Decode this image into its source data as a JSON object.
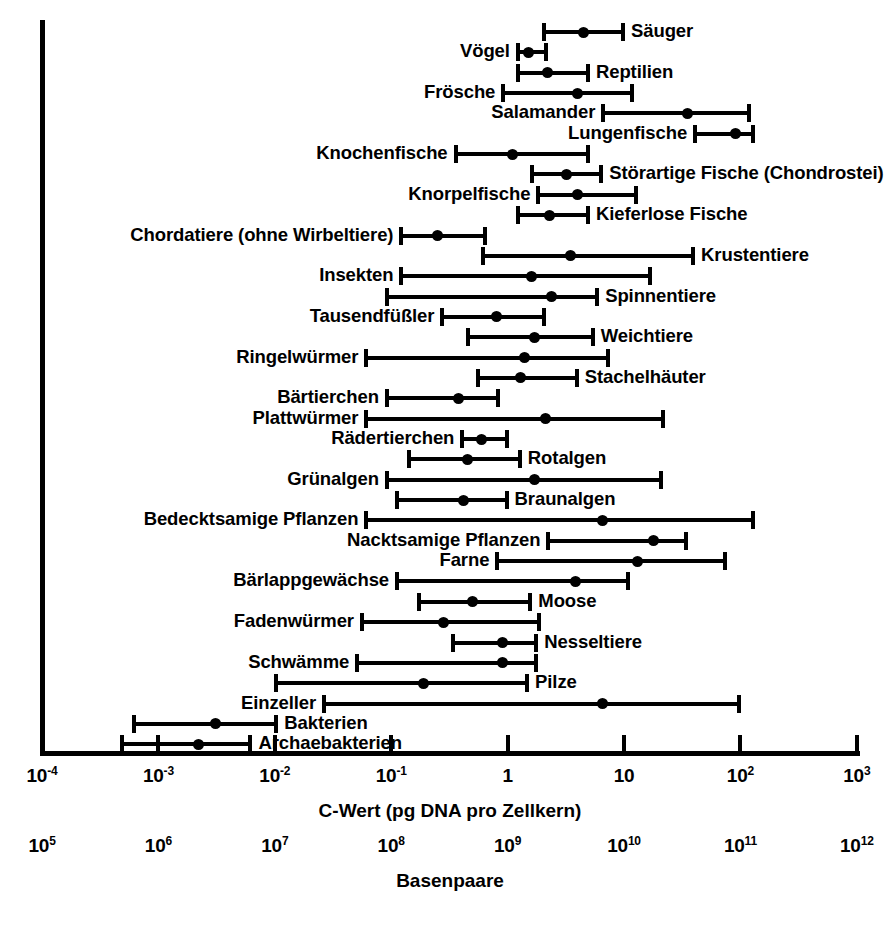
{
  "chart_data": {
    "type": "bar",
    "title": "",
    "xlabel": "C-Wert (pg DNA pro Zellkern)",
    "xlabel_secondary": "Basenpaare",
    "ylabel": "",
    "scale": "log",
    "xlim": [
      0.0001,
      1000
    ],
    "grid": false,
    "legend": null,
    "axis_primary": {
      "caption": "C-Wert (pg DNA pro Zellkern)",
      "ticks": [
        {
          "value": 0.0001,
          "label": "10",
          "exp": "-4"
        },
        {
          "value": 0.001,
          "label": "10",
          "exp": "-3"
        },
        {
          "value": 0.01,
          "label": "10",
          "exp": "-2"
        },
        {
          "value": 0.1,
          "label": "10",
          "exp": "-1"
        },
        {
          "value": 1,
          "label": "1",
          "exp": ""
        },
        {
          "value": 10,
          "label": "10",
          "exp": ""
        },
        {
          "value": 100,
          "label": "10",
          "exp": "2"
        },
        {
          "value": 1000,
          "label": "10",
          "exp": "3"
        }
      ]
    },
    "axis_secondary": {
      "caption": "Basenpaare",
      "ticks": [
        {
          "label": "10",
          "exp": "5"
        },
        {
          "label": "10",
          "exp": "6"
        },
        {
          "label": "10",
          "exp": "7"
        },
        {
          "label": "10",
          "exp": "8"
        },
        {
          "label": "10",
          "exp": "9"
        },
        {
          "label": "10",
          "exp": "10"
        },
        {
          "label": "10",
          "exp": "11"
        },
        {
          "label": "10",
          "exp": "12"
        }
      ]
    },
    "series_note": "Each row: min and max C-value (range whiskers) with a typical/median dot.",
    "rows": [
      {
        "label": "Säuger",
        "side": "right",
        "min": 2.0,
        "typical": 4.5,
        "max": 10.0
      },
      {
        "label": "Vögel",
        "side": "left",
        "min": 1.2,
        "typical": 1.5,
        "max": 2.2
      },
      {
        "label": "Reptilien",
        "side": "right",
        "min": 1.2,
        "typical": 2.2,
        "max": 5.0
      },
      {
        "label": "Frösche",
        "side": "left",
        "min": 0.9,
        "typical": 4.0,
        "max": 12.0
      },
      {
        "label": "Salamander",
        "side": "left",
        "min": 6.5,
        "typical": 35.0,
        "max": 120.0
      },
      {
        "label": "Lungenfische",
        "side": "left",
        "min": 40.0,
        "typical": 90.0,
        "max": 130.0
      },
      {
        "label": "Knochenfische",
        "side": "left",
        "min": 0.35,
        "typical": 1.1,
        "max": 5.0
      },
      {
        "label": "Störartige Fische (Chondrostei)",
        "side": "right",
        "min": 1.6,
        "typical": 3.2,
        "max": 6.5
      },
      {
        "label": "Knorpelfische",
        "side": "left",
        "min": 1.8,
        "typical": 4.0,
        "max": 13.0
      },
      {
        "label": "Kieferlose Fische",
        "side": "right",
        "min": 1.2,
        "typical": 2.3,
        "max": 5.0
      },
      {
        "label": "Chordatiere (ohne Wirbeltiere)",
        "side": "left",
        "min": 0.12,
        "typical": 0.25,
        "max": 0.65
      },
      {
        "label": "Krustentiere",
        "side": "right",
        "min": 0.6,
        "typical": 3.5,
        "max": 40.0
      },
      {
        "label": "Insekten",
        "side": "left",
        "min": 0.12,
        "typical": 1.6,
        "max": 17.0
      },
      {
        "label": "Spinnentiere",
        "side": "right",
        "min": 0.09,
        "typical": 2.4,
        "max": 6.0
      },
      {
        "label": "Tausendfüßler",
        "side": "left",
        "min": 0.27,
        "typical": 0.8,
        "max": 2.1
      },
      {
        "label": "Weichtiere",
        "side": "right",
        "min": 0.45,
        "typical": 1.7,
        "max": 5.5
      },
      {
        "label": "Ringelwürmer",
        "side": "left",
        "min": 0.06,
        "typical": 1.4,
        "max": 7.5
      },
      {
        "label": "Stachelhäuter",
        "side": "right",
        "min": 0.55,
        "typical": 1.3,
        "max": 4.0
      },
      {
        "label": "Bärtierchen",
        "side": "left",
        "min": 0.09,
        "typical": 0.38,
        "max": 0.85
      },
      {
        "label": "Plattwürmer",
        "side": "left",
        "min": 0.06,
        "typical": 2.1,
        "max": 22.0
      },
      {
        "label": "Rädertierchen",
        "side": "left",
        "min": 0.4,
        "typical": 0.6,
        "max": 1.0
      },
      {
        "label": "Rotalgen",
        "side": "right",
        "min": 0.14,
        "typical": 0.45,
        "max": 1.3
      },
      {
        "label": "Grünalgen",
        "side": "left",
        "min": 0.09,
        "typical": 1.7,
        "max": 21.0
      },
      {
        "label": "Braunalgen",
        "side": "right",
        "min": 0.11,
        "typical": 0.42,
        "max": 1.0
      },
      {
        "label": "Bedecktsamige Pflanzen",
        "side": "left",
        "min": 0.06,
        "typical": 6.5,
        "max": 130.0
      },
      {
        "label": "Nacktsamige Pflanzen",
        "side": "left",
        "min": 2.2,
        "typical": 18.0,
        "max": 35.0
      },
      {
        "label": "Farne",
        "side": "left",
        "min": 0.8,
        "typical": 13.0,
        "max": 75.0
      },
      {
        "label": "Bärlappgewächse",
        "side": "left",
        "min": 0.11,
        "typical": 3.8,
        "max": 11.0
      },
      {
        "label": "Moose",
        "side": "right",
        "min": 0.17,
        "typical": 0.5,
        "max": 1.6
      },
      {
        "label": "Fadenwürmer",
        "side": "left",
        "min": 0.055,
        "typical": 0.28,
        "max": 1.9
      },
      {
        "label": "Nesseltiere",
        "side": "right",
        "min": 0.33,
        "typical": 0.9,
        "max": 1.8
      },
      {
        "label": "Schwämme",
        "side": "left",
        "min": 0.05,
        "typical": 0.9,
        "max": 1.8
      },
      {
        "label": "Pilze",
        "side": "right",
        "min": 0.01,
        "typical": 0.19,
        "max": 1.5
      },
      {
        "label": "Einzeller",
        "side": "left",
        "min": 0.026,
        "typical": 6.5,
        "max": 100.0
      },
      {
        "label": "Bakterien",
        "side": "right",
        "min": 0.0006,
        "typical": 0.0031,
        "max": 0.0105
      },
      {
        "label": "Archaebakterien",
        "side": "right",
        "min": 0.00048,
        "typical": 0.0022,
        "max": 0.0063
      }
    ]
  },
  "colors": {
    "ink": "#000000",
    "background": "#ffffff"
  }
}
